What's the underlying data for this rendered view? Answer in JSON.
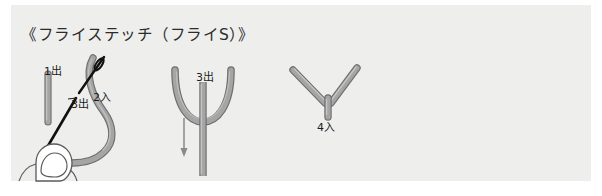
{
  "figure": {
    "title": "《フライステッチ（フライS）》",
    "panel_color": "#eeeeec",
    "page_color": "#ffffff",
    "thread_color": "#9a9a9a",
    "thread_outline_color": "#6e6e6e",
    "needle_color": "#111111",
    "hand_color": "#ffffff",
    "label_color": "#1c1c1c"
  },
  "steps": [
    {
      "id": "step-1",
      "name": "needle-insert-step",
      "labels": [
        {
          "key": "out1",
          "text": "1出"
        },
        {
          "key": "in2",
          "text": "2入"
        },
        {
          "key": "out3",
          "text": "3出"
        }
      ],
      "elements": [
        "thread-curve",
        "thread-stub",
        "needle",
        "hand-finger"
      ]
    },
    {
      "id": "step-2",
      "name": "loop-pull-step",
      "labels": [
        {
          "key": "out3",
          "text": "3出"
        }
      ],
      "elements": [
        "u-loop",
        "vertical-thread",
        "down-arrow"
      ]
    },
    {
      "id": "step-3",
      "name": "finished-fly-stitch-step",
      "labels": [
        {
          "key": "in4",
          "text": "4入"
        }
      ],
      "elements": [
        "v-arms",
        "tail-stitch"
      ]
    }
  ],
  "labels": {
    "out1": "1出",
    "in2": "2入",
    "out3_left": "3出",
    "out3_mid": "3出",
    "in4": "4入"
  }
}
